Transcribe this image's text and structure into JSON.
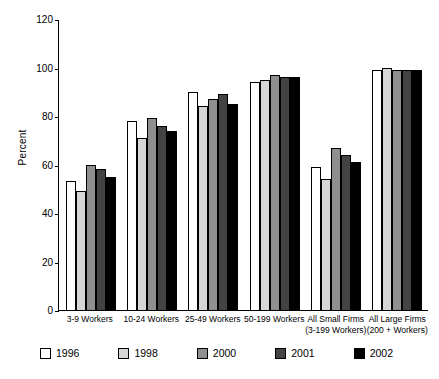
{
  "chart_data": {
    "type": "bar",
    "title": "",
    "xlabel": "",
    "ylabel": "Percent",
    "ylim": [
      0,
      120
    ],
    "yticks": [
      0,
      20,
      40,
      60,
      80,
      100,
      120
    ],
    "grid": false,
    "legend_position": "bottom",
    "categories": [
      "3-9 Workers",
      "10-24 Workers",
      "25-49 Workers",
      "50-199 Workers",
      "All Small Firms (3-199 Workers)",
      "All Large Firms (200 + Workers)"
    ],
    "category_lines": [
      {
        "line1": "3-9 Workers",
        "line2": ""
      },
      {
        "line1": "10-24 Workers",
        "line2": ""
      },
      {
        "line1": "25-49 Workers",
        "line2": ""
      },
      {
        "line1": "50-199 Workers",
        "line2": ""
      },
      {
        "line1": "All Small Firms",
        "line2": "(3-199 Workers)"
      },
      {
        "line1": "All Large Firms",
        "line2": "(200 + Workers)"
      }
    ],
    "series": [
      {
        "name": "1996",
        "color": "#ffffff",
        "values": [
          53,
          78,
          90,
          94,
          59,
          99
        ]
      },
      {
        "name": "1998",
        "color": "#d6d6d6",
        "values": [
          49,
          71,
          84,
          95,
          54,
          100
        ]
      },
      {
        "name": "2000",
        "color": "#8f8f8f",
        "values": [
          60,
          79,
          87,
          97,
          67,
          99
        ]
      },
      {
        "name": "2001",
        "color": "#434343",
        "values": [
          58,
          76,
          89,
          96,
          64,
          99
        ]
      },
      {
        "name": "2002",
        "color": "#000000",
        "values": [
          55,
          74,
          85,
          96,
          61,
          99
        ]
      }
    ]
  },
  "legend": {
    "items": [
      {
        "label": "1996",
        "swatch_class": "sw-1996"
      },
      {
        "label": "1998",
        "swatch_class": "sw-1998"
      },
      {
        "label": "2000",
        "swatch_class": "sw-2000"
      },
      {
        "label": "2001",
        "swatch_class": "sw-2001"
      },
      {
        "label": "2002",
        "swatch_class": "sw-2002"
      }
    ]
  }
}
